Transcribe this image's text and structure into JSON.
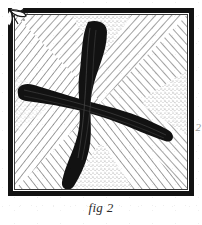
{
  "figure": {
    "caption": "fig 2",
    "margin_mark": "2",
    "title": "fig 2"
  },
  "frame": {
    "outer_border_color": "#121212",
    "inner_border_color": "#3a3a3a",
    "paper_color": "#ffffff",
    "outer_border_width": 5,
    "inner_gap": 3
  },
  "palette": {
    "ink": "#121212",
    "hatch_line": "#4a4a4a",
    "stipple": "#8d8d8d",
    "paper": "#ffffff",
    "caption_ink": "#2b2b2b",
    "margin_ink": "#9a9a9a"
  },
  "panel": {
    "width": 186,
    "height": 188,
    "hatching": {
      "style": "radial-diagonal",
      "quadrant_count": 4,
      "line_spacing_px": 6,
      "quadrants": [
        {
          "name": "top-left",
          "direction": "down-right",
          "angle_deg": 42
        },
        {
          "name": "top-right",
          "direction": "down-left",
          "angle_deg": -42
        },
        {
          "name": "bottom-left",
          "direction": "up-right",
          "angle_deg": -38
        },
        {
          "name": "bottom-right",
          "direction": "up-left",
          "angle_deg": 38
        }
      ]
    },
    "stipple_wedges": [
      {
        "name": "top-center",
        "position": "top"
      },
      {
        "name": "bottom-center",
        "position": "bottom"
      },
      {
        "name": "right-middle",
        "position": "right"
      },
      {
        "name": "left-middle",
        "position": "left"
      }
    ]
  },
  "cross": {
    "label": "brush-stroke-cross",
    "color": "#121212",
    "stroke_count": 2,
    "strokes": [
      {
        "name": "vertical-stroke",
        "from": "top-center",
        "to": "bottom-center",
        "max_width_px": 17
      },
      {
        "name": "horizontal-stroke",
        "from": "left-middle",
        "to": "right-middle",
        "max_width_px": 15
      }
    ],
    "center": {
      "x": 93,
      "y": 92
    }
  },
  "corner_ornament": {
    "name": "ink-splash-ornament",
    "position": "top-left",
    "color": "#121212"
  }
}
